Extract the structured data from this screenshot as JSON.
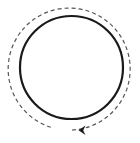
{
  "diagram": {
    "type": "cycle-icon",
    "solid_circle": {
      "cx": 71.5,
      "cy": 67.5,
      "r": 52,
      "stroke": "#1a1a1a",
      "stroke_width": 2.2
    },
    "dashed_arc": {
      "cx": 71.5,
      "cy": 69,
      "r": 61,
      "stroke": "#555555",
      "stroke_width": 1.2,
      "dash": "4 3",
      "direction": "clockwise"
    },
    "arrowhead": {
      "tip_x": 79,
      "tip_y": 130,
      "pointing": "left",
      "color": "#1a1a1a"
    }
  }
}
